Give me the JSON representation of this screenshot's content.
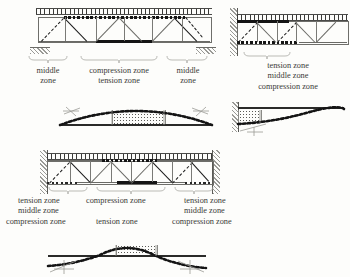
{
  "figure": {
    "zone_terms": {
      "tension": "tension zone",
      "compression": "compression zone",
      "middle": "middle zone"
    },
    "colors": {
      "ink": "#2a2a28",
      "rule": "#6a6a66",
      "bold_member": "#141414",
      "hatch": "#9a9a96",
      "paper": "#fdfdfb"
    }
  },
  "panels": [
    {
      "id": "simply-supported-truss",
      "name": "Simply supported parallel-chord truss",
      "support_type": "pin and roller on hatched pads",
      "deck": "ticked loading deck",
      "top_chord_marking": "dotted band at midspan",
      "bottom_chord_marking": "solid black band at midspan",
      "zone_labels": [
        {
          "position": "left",
          "lines": [
            "middle",
            "zone"
          ]
        },
        {
          "position": "center",
          "lines": [
            "compression zone",
            "tension zone"
          ]
        },
        {
          "position": "right",
          "lines": [
            "middle",
            "zone"
          ]
        }
      ]
    },
    {
      "id": "cantilever-truss",
      "name": "Cantilever parallel-chord truss fixed at wall",
      "support_type": "fixed wall at left end",
      "deck": "ticked loading deck",
      "top_chord_marking": "solid black band near support",
      "bottom_chord_marking": "dotted band near support",
      "zone_labels": [
        {
          "position": "stack",
          "lines": [
            "tension zone",
            "middle zone",
            "compression zone"
          ]
        }
      ]
    },
    {
      "id": "simply-supported-beam-curve",
      "name": "Simply supported beam deflection curve",
      "support_type": "pin and roller",
      "curve": "single hogging arc above straight reference line",
      "fill": "stippled midspan block"
    },
    {
      "id": "cantilever-beam-curve",
      "name": "Cantilever beam deflection curve",
      "support_type": "fixed wall at left end",
      "curve": "curve descending from wall toward free end",
      "fill": "stippled block at fixed end"
    },
    {
      "id": "fixed-fixed-truss",
      "name": "Parallel-chord truss fixed at both ends",
      "support_type": "fixed walls at both ends",
      "deck": "ticked loading deck",
      "top_chord_marking": "dotted band at midspan",
      "bottom_chord_marking": "solid black band at midspan with dotted bands at ends",
      "zone_labels": [
        {
          "position": "left",
          "lines": [
            "tension zone",
            "middle zone",
            "compression zone"
          ]
        },
        {
          "position": "center",
          "lines": [
            "compression zone",
            "tension zone"
          ]
        },
        {
          "position": "right",
          "lines": [
            "tension zone",
            "middle zone",
            "compression zone"
          ]
        }
      ]
    },
    {
      "id": "fixed-fixed-beam-curve",
      "name": "Fixed-fixed beam deflection curve",
      "support_type": "fixed at both ends",
      "curve": "hogging midspan arc with inflection points and downturned ends",
      "fill": "stippled midspan block"
    }
  ]
}
